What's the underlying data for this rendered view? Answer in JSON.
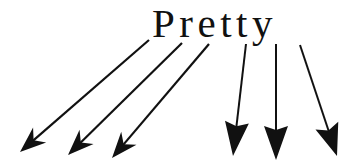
{
  "figure": {
    "background_color": "#ffffff",
    "ink_color": "#111111",
    "width": 355,
    "height": 161,
    "word": {
      "text": "Pretty",
      "letters": [
        "P",
        "r",
        "e",
        "t",
        "t",
        "y"
      ],
      "x": 152,
      "baseline_y": 37,
      "font_size": 41,
      "letter_spacing": 4.5
    },
    "arrows": [
      {
        "id": "arrow-from-p",
        "label": "P",
        "tail_x": 149,
        "tail_y": 40,
        "tip_x": 20,
        "tip_y": 152,
        "stroke_width": 2.2,
        "head_length": 26,
        "head_half_width": 10,
        "head_notch": 8,
        "direction": "down-left"
      },
      {
        "id": "arrow-from-r",
        "label": "r",
        "tail_x": 182,
        "tail_y": 43,
        "tip_x": 68,
        "tip_y": 155,
        "stroke_width": 2.2,
        "head_length": 26,
        "head_half_width": 10,
        "head_notch": 8,
        "direction": "down-left"
      },
      {
        "id": "arrow-from-e",
        "label": "e",
        "tail_x": 209,
        "tail_y": 44,
        "tip_x": 112,
        "tip_y": 158,
        "stroke_width": 2.2,
        "head_length": 26,
        "head_half_width": 10,
        "head_notch": 8,
        "direction": "down-left"
      },
      {
        "id": "arrow-from-t1",
        "label": "t",
        "tail_x": 246,
        "tail_y": 44,
        "tip_x": 233,
        "tip_y": 156,
        "stroke_width": 2.0,
        "head_length": 34,
        "head_half_width": 12,
        "head_notch": 4,
        "direction": "down"
      },
      {
        "id": "arrow-from-t2",
        "label": "t",
        "tail_x": 276,
        "tail_y": 44,
        "tip_x": 276,
        "tip_y": 160,
        "stroke_width": 2.0,
        "head_length": 34,
        "head_half_width": 12,
        "head_notch": 4,
        "direction": "down"
      },
      {
        "id": "arrow-from-y",
        "label": "y",
        "tail_x": 300,
        "tail_y": 45,
        "tip_x": 337,
        "tip_y": 156,
        "stroke_width": 2.0,
        "head_length": 32,
        "head_half_width": 12,
        "head_notch": 5,
        "direction": "down-right"
      }
    ]
  }
}
